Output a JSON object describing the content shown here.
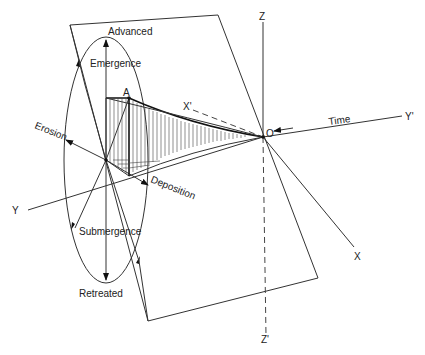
{
  "figure": {
    "labels": {
      "advanced": "Advanced",
      "emergence": "Emergence",
      "erosion": "Erosion",
      "deposition": "Deposition",
      "submergence": "Submergence",
      "retreated": "Retreated",
      "time": "Time",
      "point_a": "A",
      "origin": "O",
      "axis_x": "X",
      "axis_x_prime": "X'",
      "axis_y": "Y",
      "axis_y_prime": "Y'",
      "axis_z": "Z",
      "axis_z_prime": "Z'"
    },
    "colors": {
      "line": "#333333",
      "background": "#ffffff"
    }
  }
}
